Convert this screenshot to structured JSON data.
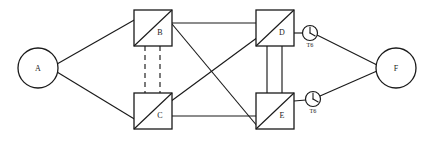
{
  "diagram": {
    "background_color": "#ffffff",
    "line_color": "#1a1a1a",
    "canvas": {
      "width": 433,
      "height": 143
    },
    "nodes": [
      {
        "id": "A",
        "label": "A",
        "shape": "circle",
        "cx": 38,
        "cy": 68,
        "r": 20,
        "label_dx": 0,
        "label_dy": 0
      },
      {
        "id": "B",
        "label": "B",
        "shape": "square-diagonal",
        "x": 134,
        "y": 10,
        "w": 38,
        "h": 36,
        "label_dx": 10,
        "label_dy": 9
      },
      {
        "id": "C",
        "label": "C",
        "shape": "square-diagonal",
        "x": 134,
        "y": 93,
        "w": 38,
        "h": 36,
        "label_dx": 10,
        "label_dy": 9
      },
      {
        "id": "D",
        "label": "D",
        "shape": "square-diagonal",
        "x": 256,
        "y": 10,
        "w": 38,
        "h": 36,
        "label_dx": 10,
        "label_dy": 9
      },
      {
        "id": "E",
        "label": "E",
        "shape": "square-diagonal",
        "x": 256,
        "y": 93,
        "w": 38,
        "h": 36,
        "label_dx": 10,
        "label_dy": 9
      },
      {
        "id": "F",
        "label": "F",
        "shape": "circle",
        "cx": 396,
        "cy": 68,
        "r": 20,
        "label_dx": 0,
        "label_dy": 0
      }
    ],
    "clocks": [
      {
        "id": "clock-d",
        "label": "T6",
        "cx": 310,
        "cy": 33,
        "r": 7.5,
        "label_y": 46
      },
      {
        "id": "clock-e",
        "label": "T6",
        "cx": 313,
        "cy": 99,
        "r": 7.5,
        "label_y": 112
      }
    ],
    "edges": [
      {
        "id": "a-b",
        "from": "A",
        "to": "B",
        "style": "solid",
        "x1": 57,
        "y1": 64,
        "x2": 136,
        "y2": 19
      },
      {
        "id": "a-c",
        "from": "A",
        "to": "C",
        "style": "solid",
        "x1": 57,
        "y1": 72,
        "x2": 136,
        "y2": 120
      },
      {
        "id": "b-c-1",
        "from": "B",
        "to": "C",
        "style": "dashed",
        "x1": 145,
        "y1": 46,
        "x2": 145,
        "y2": 93
      },
      {
        "id": "b-c-2",
        "from": "B",
        "to": "C",
        "style": "dashed",
        "x1": 160,
        "y1": 46,
        "x2": 160,
        "y2": 93
      },
      {
        "id": "b-d",
        "from": "B",
        "to": "D",
        "style": "solid",
        "x1": 172,
        "y1": 23,
        "x2": 256,
        "y2": 23
      },
      {
        "id": "b-e",
        "from": "B",
        "to": "E",
        "style": "solid",
        "x1": 172,
        "y1": 24,
        "x2": 258,
        "y2": 127
      },
      {
        "id": "c-d",
        "from": "C",
        "to": "D",
        "style": "solid",
        "x1": 136,
        "y1": 127,
        "x2": 292,
        "y2": 12
      },
      {
        "id": "c-e",
        "from": "C",
        "to": "E",
        "style": "solid",
        "x1": 172,
        "y1": 116,
        "x2": 256,
        "y2": 116
      },
      {
        "id": "d-e-1",
        "from": "D",
        "to": "E",
        "style": "solid",
        "x1": 267,
        "y1": 46,
        "x2": 267,
        "y2": 93
      },
      {
        "id": "d-e-2",
        "from": "D",
        "to": "E",
        "style": "solid",
        "x1": 282,
        "y1": 46,
        "x2": 282,
        "y2": 93
      },
      {
        "id": "d-clock",
        "from": "D",
        "to": "clock-d",
        "style": "solid",
        "x1": 294,
        "y1": 33,
        "x2": 303,
        "y2": 33
      },
      {
        "id": "clock-d-f",
        "from": "clock-d",
        "to": "F",
        "style": "solid",
        "x1": 318,
        "y1": 35,
        "x2": 377,
        "y2": 65
      },
      {
        "id": "e-clock",
        "from": "E",
        "to": "clock-e",
        "style": "solid",
        "x1": 294,
        "y1": 101,
        "x2": 306,
        "y2": 100
      },
      {
        "id": "clock-e-f",
        "from": "clock-e",
        "to": "F",
        "style": "solid",
        "x1": 320,
        "y1": 96,
        "x2": 377,
        "y2": 71
      }
    ]
  }
}
